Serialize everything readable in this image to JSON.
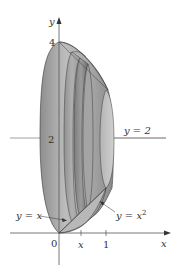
{
  "figure": {
    "axes": {
      "x_label": "x",
      "y_label": "y",
      "origin_label": "0",
      "x_ticks": [
        "x",
        "1"
      ],
      "y_ticks": [
        "4",
        "2"
      ]
    },
    "labels": {
      "axis_line": "y = 2",
      "curve_line": "y = x",
      "curve_parabola_base": "y = x",
      "curve_parabola_exp": "2"
    },
    "colors": {
      "solid_fill": "#a8a8a8",
      "solid_dark": "#7a7a7a",
      "solid_light": "#c8c8c8",
      "outline": "#3a3a3a",
      "axis": "#555555"
    }
  }
}
